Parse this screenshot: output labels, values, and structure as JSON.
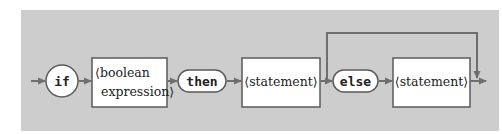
{
  "diagram": {
    "colors": {
      "panel": "#cdcdcd",
      "line": "#6e6e6e",
      "node_fill": "#ffffff",
      "node_stroke": "#5a5a5a",
      "text": "#222222"
    },
    "nodes": [
      {
        "id": "if",
        "kind": "terminal-circle",
        "label": "if"
      },
      {
        "id": "cond",
        "kind": "nonterminal",
        "lines": [
          "⟨boolean",
          "expression⟩"
        ]
      },
      {
        "id": "then",
        "kind": "terminal-pill",
        "label": "then"
      },
      {
        "id": "stmt1",
        "kind": "nonterminal",
        "lines": [
          "⟨statement⟩"
        ]
      },
      {
        "id": "else",
        "kind": "terminal-pill",
        "label": "else"
      },
      {
        "id": "stmt2",
        "kind": "nonterminal",
        "lines": [
          "⟨statement⟩"
        ]
      }
    ],
    "edges": [
      {
        "from": "start",
        "to": "if"
      },
      {
        "from": "if",
        "to": "cond"
      },
      {
        "from": "cond",
        "to": "then"
      },
      {
        "from": "then",
        "to": "stmt1"
      },
      {
        "from": "stmt1",
        "to": "else"
      },
      {
        "from": "else",
        "to": "stmt2"
      },
      {
        "from": "stmt2",
        "to": "end"
      },
      {
        "from": "stmt1",
        "to": "end",
        "kind": "bypass",
        "note": "optional else branch"
      }
    ]
  }
}
